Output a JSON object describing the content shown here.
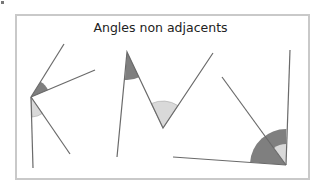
{
  "title": "Angles non adjacents",
  "colors": {
    "frame": "#c9c9c9",
    "line": "#6a6a6a",
    "dark_angle": "#7f7f7f",
    "light_angle": "#d9d9d9",
    "light_angle_stroke": "#a8a8a8"
  },
  "figures": [
    {
      "name": "figure-1",
      "vertex": [
        31,
        97
      ],
      "rays": [
        [
          64,
          44
        ],
        [
          95,
          70
        ],
        [
          35,
          168
        ],
        [
          70,
          154
        ]
      ],
      "dark_angle": "between rays to (64,44) and (95,70)",
      "light_angle": "between rays to (35,168) and (70,154)"
    },
    {
      "name": "figure-2",
      "polyline": [
        [
          117,
          157
        ],
        [
          127,
          52
        ],
        [
          163,
          128
        ],
        [
          213,
          53
        ]
      ],
      "dark_angle": "at (127,52)",
      "light_angle": "at (163,128)"
    },
    {
      "name": "figure-3",
      "vertex": [
        286,
        165
      ],
      "rays": [
        [
          290,
          50
        ],
        [
          173,
          157
        ],
        [
          222,
          77
        ]
      ],
      "dark_angle": "between rays to (173,157) and (290,50)",
      "light_angle": "between rays to (222,77) and (290,50)"
    }
  ]
}
